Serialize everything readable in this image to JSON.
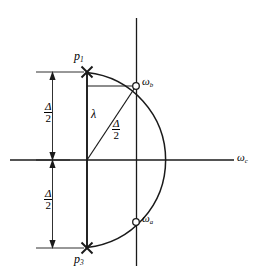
{
  "figure": {
    "type": "pole-zero-diagram",
    "axes": {
      "horizontal_label": "ω",
      "horizontal_label_sub": "c",
      "vertical_label": "",
      "stroke_color": "#1a1a1a"
    },
    "poles": [
      {
        "id": "p1",
        "label": "p",
        "sub": "1",
        "marker": "cross",
        "x": 87,
        "y": 72
      },
      {
        "id": "p3",
        "label": "p",
        "sub": "3",
        "marker": "cross",
        "x": 87,
        "y": 248
      }
    ],
    "zeros": [
      {
        "id": "wb",
        "label": "ω",
        "sub": "b",
        "marker": "open-circle",
        "x": 136,
        "y": 86
      },
      {
        "id": "wa",
        "label": "ω",
        "sub": "a",
        "marker": "open-circle",
        "x": 136,
        "y": 222
      }
    ],
    "dimensions": [
      {
        "id": "upper-delta-half",
        "numerator": "Δ",
        "denominator": "2"
      },
      {
        "id": "lower-delta-half",
        "numerator": "Δ",
        "denominator": "2"
      },
      {
        "id": "radius-delta-half",
        "numerator": "Δ",
        "denominator": "2"
      }
    ],
    "segments": [
      {
        "id": "lambda",
        "label": "λ"
      }
    ],
    "arc": {
      "center_x": 87,
      "center_y": 160,
      "radius": 88
    }
  }
}
